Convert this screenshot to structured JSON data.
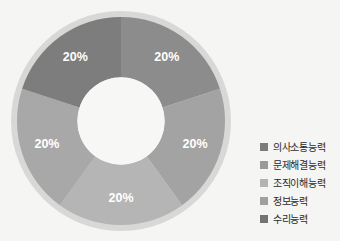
{
  "chart_data": {
    "type": "pie",
    "title": "",
    "xlabel": "",
    "ylabel": "",
    "donut": true,
    "hole_ratio": 0.42,
    "start_angle_deg": 0,
    "legend_position": "right",
    "grid": false,
    "categories": [
      "의사소통능력",
      "문제해결능력",
      "조직이해능력",
      "정보능력",
      "수리능력"
    ],
    "values": [
      20,
      20,
      20,
      20,
      20
    ],
    "value_labels": [
      "20%",
      "20%",
      "20%",
      "20%",
      "20%"
    ],
    "colors": [
      "#8c8c8c",
      "#a3a3a3",
      "#b5b5b5",
      "#a8a8a8",
      "#7d7d7d"
    ],
    "halo_color": "#d8d8d6",
    "background_color": "#f5f5f4",
    "label_color": "#ffffff"
  },
  "legend": {
    "items": [
      {
        "label": "의사소통능력",
        "color": "#7b7b7b",
        "value_label": "20%"
      },
      {
        "label": "문제해결능력",
        "color": "#9a9a9a",
        "value_label": "20%"
      },
      {
        "label": "조직이해능력",
        "color": "#b3b3b3",
        "value_label": "20%"
      },
      {
        "label": "정보능력",
        "color": "#a0a0a0",
        "value_label": "20%"
      },
      {
        "label": "수리능력",
        "color": "#737373",
        "value_label": "20%"
      }
    ]
  }
}
